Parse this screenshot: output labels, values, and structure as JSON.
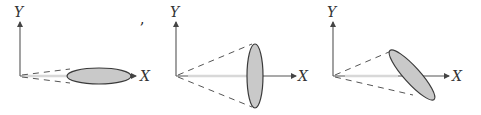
{
  "figure": {
    "colors": {
      "axis": "#555555",
      "ellipse_fill": "#c9c9c9",
      "ellipse_stroke": "#3a3a3a",
      "projection_line": "#d8d8d8"
    },
    "panels": [
      {
        "id": "panel-1",
        "x_label": "X",
        "y_label": "Y",
        "orientation": "edge-on, elongated along X axis",
        "stray_mark": ","
      },
      {
        "id": "panel-2",
        "x_label": "X",
        "y_label": "Y",
        "orientation": "face-on, elongated along Y (perpendicular to X)"
      },
      {
        "id": "panel-3",
        "x_label": "X",
        "y_label": "Y",
        "orientation": "tilted diagonally"
      }
    ]
  }
}
